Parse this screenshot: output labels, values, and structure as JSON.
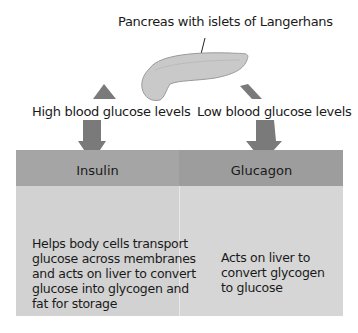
{
  "diagram": {
    "pancreas_label": "Pancreas with islets of Langerhans",
    "left_trigger": "High blood glucose levels",
    "right_trigger": "Low blood glucose levels",
    "colors": {
      "arrow": "#7a7a7a",
      "header": "#a5a5a5",
      "body": "#d2d2d2",
      "pancreas": "#c8c8c8"
    },
    "hormones": [
      {
        "name": "Insulin",
        "description": "Helps body cells transport glucose across membranes and acts on liver to convert glucose into glycogen and fat for storage",
        "lines": [
          "Helps body cells transport",
          "glucose across membranes",
          "and acts on liver to convert",
          "glucose into glycogen and",
          "fat for storage"
        ]
      },
      {
        "name": "Glucagon",
        "description": "Acts on liver to convert glycogen to glucose",
        "lines": [
          "Acts on liver to",
          "convert glycogen",
          "to glucose"
        ]
      }
    ]
  }
}
